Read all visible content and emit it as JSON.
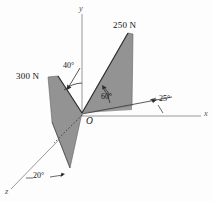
{
  "figure": {
    "background_color": "#fdfdfd",
    "shade_color": "#8a8a8a",
    "line_color": "#4a4a4a",
    "text_color": "#141414",
    "axes": [
      {
        "id": "y-axis",
        "label": "y",
        "x": 82,
        "y": 8
      },
      {
        "id": "x-axis",
        "label": "x",
        "x": 204,
        "y": 113
      },
      {
        "id": "z-axis",
        "label": "z",
        "x": 6,
        "y": 192
      }
    ],
    "origin": {
      "label": "O",
      "x": 86,
      "y": 117
    },
    "forces": [
      {
        "id": "force-left",
        "label": "300 N",
        "x": 16,
        "y": 72,
        "magnitude": 300,
        "unit": "N"
      },
      {
        "id": "force-right",
        "label": "250 N",
        "x": 113,
        "y": 22,
        "magnitude": 250,
        "unit": "N"
      }
    ],
    "angles": [
      {
        "id": "angle-40",
        "label": "40°",
        "value": 40,
        "x": 63,
        "y": 64,
        "description": "between y-axis and 300 N force line"
      },
      {
        "id": "angle-60",
        "label": "60°",
        "value": 60,
        "x": 103,
        "y": 92,
        "description": "between base line and 250 N force line"
      },
      {
        "id": "angle-25",
        "label": "25°",
        "value": 25,
        "x": 160,
        "y": 101,
        "description": "between x-axis and right base line"
      },
      {
        "id": "angle-20",
        "label": "20°",
        "value": 20,
        "x": 33,
        "y": 176,
        "description": "between z-axis and left base line"
      }
    ]
  }
}
